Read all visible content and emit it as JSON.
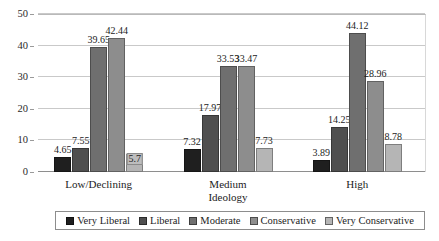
{
  "chart_data": {
    "type": "bar",
    "title": "",
    "subtitle": "",
    "xlabel": "Ideology",
    "ylabel": "",
    "categories": [
      "Low/Declining",
      "Medium",
      "High"
    ],
    "ylim": [
      0,
      50
    ],
    "yticks": [
      0,
      10,
      20,
      30,
      40,
      50
    ],
    "ytick_labels": [
      "0",
      "10",
      "20",
      "30",
      "40",
      "50"
    ],
    "grid": true,
    "legend_position": "bottom",
    "series": [
      {
        "name": "Very Liberal",
        "color": "#1f1f1f",
        "values": [
          4.65,
          7.32,
          3.89
        ],
        "labels": [
          "4.65",
          "7.32",
          "3.89"
        ]
      },
      {
        "name": "Liberal",
        "color": "#4f4f4f",
        "values": [
          7.55,
          17.97,
          14.25
        ],
        "labels": [
          "7.55",
          "17.97",
          "14.25"
        ]
      },
      {
        "name": "Moderate",
        "color": "#6f6f6f",
        "values": [
          39.65,
          33.53,
          44.12
        ],
        "labels": [
          "39.65",
          "33.53",
          "44.12"
        ]
      },
      {
        "name": "Conservative",
        "color": "#8d8d8d",
        "values": [
          42.44,
          33.47,
          28.96
        ],
        "labels": [
          "42.44",
          "33.47",
          "28.96"
        ]
      },
      {
        "name": "Very Conservative",
        "color": "#b5b5b5",
        "values": [
          5.7,
          7.73,
          8.78
        ],
        "labels": [
          "5.7",
          "7.73",
          "8.78"
        ]
      }
    ]
  },
  "legend": {
    "items": [
      {
        "label": "Very Liberal",
        "color": "#1f1f1f"
      },
      {
        "label": "Liberal",
        "color": "#4f4f4f"
      },
      {
        "label": "Moderate",
        "color": "#6f6f6f"
      },
      {
        "label": "Conservative",
        "color": "#8d8d8d"
      },
      {
        "label": "Very Conservative",
        "color": "#b5b5b5"
      }
    ]
  }
}
